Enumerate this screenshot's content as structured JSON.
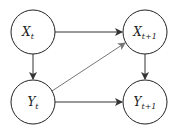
{
  "diagram": {
    "nodes": [
      {
        "id": "xt",
        "base": "X",
        "sub": "t"
      },
      {
        "id": "xt1",
        "base": "X",
        "sub": "t+1"
      },
      {
        "id": "yt",
        "base": "Y",
        "sub": "t"
      },
      {
        "id": "yt1",
        "base": "Y",
        "sub": "t+1"
      }
    ],
    "edges": [
      {
        "from": "xt",
        "to": "xt1"
      },
      {
        "from": "xt",
        "to": "yt"
      },
      {
        "from": "yt",
        "to": "xt1"
      },
      {
        "from": "yt",
        "to": "yt1"
      },
      {
        "from": "xt1",
        "to": "yt1"
      }
    ]
  }
}
